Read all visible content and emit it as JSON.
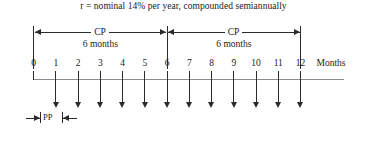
{
  "diagram": {
    "formula": {
      "symbol": "r",
      "text": "r = nominal 14% per year, compounded semiannually"
    },
    "axis": {
      "title": "Months",
      "tick_labels": [
        "0",
        "1",
        "2",
        "3",
        "4",
        "5",
        "6",
        "7",
        "8",
        "9",
        "10",
        "11",
        "12"
      ],
      "min": 0,
      "max": 12
    },
    "periods": [
      {
        "label": "CP",
        "sublabel": "6 months",
        "start": 0,
        "end": 6
      },
      {
        "label": "CP",
        "sublabel": "6 months",
        "start": 6,
        "end": 12
      }
    ],
    "payment_period": {
      "label": "PP",
      "sublabel": "1 month",
      "length_months": 1
    },
    "payments": {
      "at_months": [
        1,
        2,
        3,
        4,
        5,
        6,
        7,
        8,
        9,
        10,
        11,
        12
      ],
      "direction": "down"
    },
    "colors": {
      "ink": "#2b2b2b",
      "axis": "#8d8d8d",
      "background": "#ffffff"
    }
  }
}
